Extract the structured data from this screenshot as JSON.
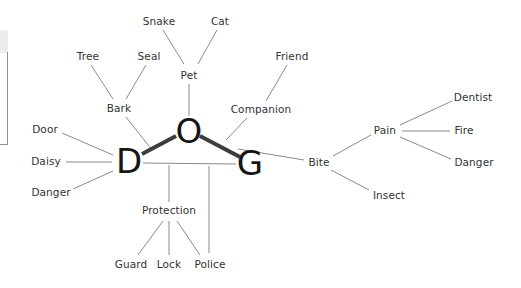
{
  "colors": {
    "bg": "#ffffff",
    "text": "#323232",
    "letter": "#151515",
    "line_thin": "#8a8a8a",
    "line_thick": "#3c3c3c",
    "panel_fill": "#ececec",
    "panel_border": "#909090"
  },
  "diagram": {
    "center_word": "DOG",
    "letters": [
      {
        "id": "letter-d",
        "label": "D",
        "x": 129,
        "y": 162
      },
      {
        "id": "letter-o",
        "label": "O",
        "x": 189,
        "y": 132
      },
      {
        "id": "letter-g",
        "label": "G",
        "x": 250,
        "y": 164
      }
    ],
    "words": [
      {
        "id": "snake",
        "label": "Snake",
        "x": 159,
        "y": 22
      },
      {
        "id": "cat",
        "label": "Cat",
        "x": 220,
        "y": 22
      },
      {
        "id": "tree",
        "label": "Tree",
        "x": 88,
        "y": 57
      },
      {
        "id": "seal",
        "label": "Seal",
        "x": 149,
        "y": 57
      },
      {
        "id": "friend",
        "label": "Friend",
        "x": 292,
        "y": 57
      },
      {
        "id": "pet",
        "label": "Pet",
        "x": 189,
        "y": 76
      },
      {
        "id": "bark",
        "label": "Bark",
        "x": 119,
        "y": 109
      },
      {
        "id": "companion",
        "label": "Companion",
        "x": 261,
        "y": 110
      },
      {
        "id": "dentist",
        "label": "Dentist",
        "x": 473,
        "y": 98
      },
      {
        "id": "door",
        "label": "Door",
        "x": 45,
        "y": 130
      },
      {
        "id": "pain",
        "label": "Pain",
        "x": 385,
        "y": 131
      },
      {
        "id": "fire",
        "label": "Fire",
        "x": 464,
        "y": 131
      },
      {
        "id": "daisy",
        "label": "Daisy",
        "x": 46,
        "y": 162
      },
      {
        "id": "bite",
        "label": "Bite",
        "x": 319,
        "y": 163
      },
      {
        "id": "danger-right",
        "label": "Danger",
        "x": 474,
        "y": 163
      },
      {
        "id": "danger-left",
        "label": "Danger",
        "x": 51,
        "y": 193
      },
      {
        "id": "insect",
        "label": "Insect",
        "x": 389,
        "y": 196
      },
      {
        "id": "protection",
        "label": "Protection",
        "x": 169,
        "y": 211
      },
      {
        "id": "guard",
        "label": "Guard",
        "x": 131,
        "y": 265
      },
      {
        "id": "lock",
        "label": "Lock",
        "x": 169,
        "y": 265
      },
      {
        "id": "police",
        "label": "Police",
        "x": 210,
        "y": 265
      }
    ],
    "edges": [
      {
        "from": "snake",
        "to": "pet",
        "x1": 163,
        "y1": 30,
        "x2": 184,
        "y2": 64,
        "thick": false
      },
      {
        "from": "cat",
        "to": "pet",
        "x1": 217,
        "y1": 30,
        "x2": 198,
        "y2": 64,
        "thick": false
      },
      {
        "from": "tree",
        "to": "bark",
        "x1": 91,
        "y1": 65,
        "x2": 113,
        "y2": 99,
        "thick": false
      },
      {
        "from": "seal",
        "to": "bark",
        "x1": 146,
        "y1": 65,
        "x2": 126,
        "y2": 99,
        "thick": false
      },
      {
        "from": "pet",
        "to": "letter-o",
        "x1": 189,
        "y1": 84,
        "x2": 189,
        "y2": 116,
        "thick": false
      },
      {
        "from": "friend",
        "to": "companion",
        "x1": 287,
        "y1": 65,
        "x2": 266,
        "y2": 101,
        "thick": false
      },
      {
        "from": "bark",
        "to": "letter-d",
        "x1": 126,
        "y1": 117,
        "x2": 152,
        "y2": 150,
        "thick": false
      },
      {
        "from": "door",
        "to": "letter-d",
        "x1": 62,
        "y1": 133,
        "x2": 113,
        "y2": 155,
        "thick": false
      },
      {
        "from": "daisy",
        "to": "letter-d",
        "x1": 66,
        "y1": 162,
        "x2": 112,
        "y2": 162,
        "thick": false
      },
      {
        "from": "danger-left",
        "to": "letter-d",
        "x1": 73,
        "y1": 189,
        "x2": 113,
        "y2": 171,
        "thick": false
      },
      {
        "from": "companion",
        "to": "letter-o",
        "x1": 247,
        "y1": 118,
        "x2": 226,
        "y2": 140,
        "thick": false
      },
      {
        "from": "letter-g",
        "to": "bite",
        "x1": 238,
        "y1": 149,
        "x2": 304,
        "y2": 160,
        "thick": false
      },
      {
        "from": "bite",
        "to": "pain",
        "x1": 333,
        "y1": 156,
        "x2": 371,
        "y2": 135,
        "thick": false
      },
      {
        "from": "bite",
        "to": "insect",
        "x1": 331,
        "y1": 170,
        "x2": 369,
        "y2": 190,
        "thick": false
      },
      {
        "from": "pain",
        "to": "dentist",
        "x1": 400,
        "y1": 125,
        "x2": 452,
        "y2": 101,
        "thick": false
      },
      {
        "from": "pain",
        "to": "fire",
        "x1": 402,
        "y1": 131,
        "x2": 450,
        "y2": 131,
        "thick": false
      },
      {
        "from": "pain",
        "to": "danger-right",
        "x1": 400,
        "y1": 137,
        "x2": 451,
        "y2": 159,
        "thick": false
      },
      {
        "from": "letter-d",
        "to": "letter-g",
        "x1": 143,
        "y1": 163,
        "x2": 236,
        "y2": 164,
        "thick": false
      },
      {
        "from": "baseline",
        "to": "protection",
        "x1": 169,
        "y1": 165,
        "x2": 169,
        "y2": 202,
        "thick": false
      },
      {
        "from": "baseline",
        "to": "police",
        "x1": 209,
        "y1": 166,
        "x2": 209,
        "y2": 253,
        "thick": false
      },
      {
        "from": "protection",
        "to": "guard",
        "x1": 163,
        "y1": 221,
        "x2": 138,
        "y2": 255,
        "thick": false
      },
      {
        "from": "protection",
        "to": "lock",
        "x1": 169,
        "y1": 221,
        "x2": 169,
        "y2": 255,
        "thick": false
      },
      {
        "from": "protection",
        "to": "police",
        "x1": 177,
        "y1": 221,
        "x2": 200,
        "y2": 255,
        "thick": false
      },
      {
        "from": "letter-d",
        "to": "letter-o",
        "x1": 142,
        "y1": 154,
        "x2": 176,
        "y2": 136,
        "thick": true
      },
      {
        "from": "letter-o",
        "to": "letter-g",
        "x1": 200,
        "y1": 136,
        "x2": 240,
        "y2": 157,
        "thick": true
      }
    ]
  }
}
